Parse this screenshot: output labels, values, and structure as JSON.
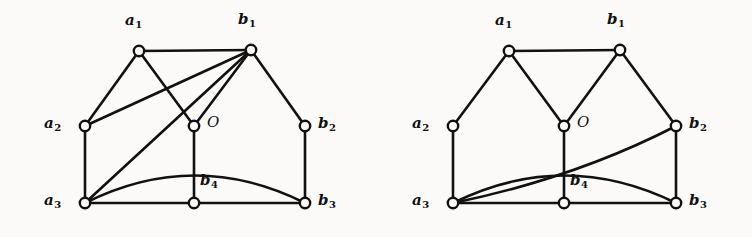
{
  "figure": {
    "background_color": "#fbfaf8",
    "ink_color": "#111111",
    "width": 752,
    "height": 237,
    "panel_count": 2
  },
  "chart_data": {
    "type": "diagram",
    "title": "",
    "subtitle": "",
    "xlabel": "",
    "ylabel": "",
    "graphs": [
      {
        "name": "left-graph",
        "vertex_labels": [
          "a1",
          "b1",
          "a2",
          "O",
          "b2",
          "a3",
          "b4",
          "b3"
        ],
        "vertices": [
          {
            "id": "a1",
            "label_main": "a",
            "label_sub": "1",
            "x": 139,
            "y": 51,
            "label_x": 125,
            "label_y": 13,
            "label_pos": "above"
          },
          {
            "id": "b1",
            "label_main": "b",
            "label_sub": "1",
            "x": 251,
            "y": 50,
            "label_x": 238,
            "label_y": 12,
            "label_pos": "above"
          },
          {
            "id": "a2",
            "label_main": "a",
            "label_sub": "2",
            "x": 85,
            "y": 126,
            "label_x": 44,
            "label_y": 116,
            "label_pos": "left"
          },
          {
            "id": "O",
            "label_main": "O",
            "label_sub": "",
            "x": 194,
            "y": 126,
            "label_x": 207,
            "label_y": 115,
            "label_pos": "right"
          },
          {
            "id": "b2",
            "label_main": "b",
            "label_sub": "2",
            "x": 305,
            "y": 126,
            "label_x": 318,
            "label_y": 116,
            "label_pos": "right"
          },
          {
            "id": "a3",
            "label_main": "a",
            "label_sub": "3",
            "x": 85,
            "y": 203,
            "label_x": 44,
            "label_y": 193,
            "label_pos": "left"
          },
          {
            "id": "b4",
            "label_main": "b",
            "label_sub": "4",
            "x": 194,
            "y": 203,
            "label_x": 200,
            "label_y": 173,
            "label_pos": "above-right"
          },
          {
            "id": "b3",
            "label_main": "b",
            "label_sub": "3",
            "x": 305,
            "y": 203,
            "label_x": 318,
            "label_y": 193,
            "label_pos": "right"
          }
        ],
        "straight_edges": [
          [
            "a1",
            "b1"
          ],
          [
            "a1",
            "a2"
          ],
          [
            "a1",
            "O"
          ],
          [
            "b1",
            "a2"
          ],
          [
            "b1",
            "a3"
          ],
          [
            "b1",
            "O"
          ],
          [
            "b1",
            "b2"
          ],
          [
            "a2",
            "a3"
          ],
          [
            "O",
            "b4"
          ],
          [
            "b2",
            "b3"
          ],
          [
            "a3",
            "b4"
          ],
          [
            "b4",
            "b3"
          ]
        ],
        "curved_edges": [
          {
            "from": "a3",
            "to": "b3",
            "bulge": "up",
            "ctrl_x": 195,
            "ctrl_y": 148
          }
        ]
      },
      {
        "name": "right-graph",
        "vertex_labels": [
          "a1",
          "b1",
          "a2",
          "O",
          "b2",
          "a3",
          "b4",
          "b3"
        ],
        "vertices": [
          {
            "id": "a1",
            "label_main": "a",
            "label_sub": "1",
            "x": 509,
            "y": 51,
            "label_x": 495,
            "label_y": 13,
            "label_pos": "above"
          },
          {
            "id": "b1",
            "label_main": "b",
            "label_sub": "1",
            "x": 620,
            "y": 50,
            "label_x": 607,
            "label_y": 12,
            "label_pos": "above"
          },
          {
            "id": "a2",
            "label_main": "a",
            "label_sub": "2",
            "x": 453,
            "y": 126,
            "label_x": 412,
            "label_y": 116,
            "label_pos": "left"
          },
          {
            "id": "O",
            "label_main": "O",
            "label_sub": "",
            "x": 564,
            "y": 126,
            "label_x": 577,
            "label_y": 115,
            "label_pos": "right"
          },
          {
            "id": "b2",
            "label_main": "b",
            "label_sub": "2",
            "x": 676,
            "y": 126,
            "label_x": 689,
            "label_y": 116,
            "label_pos": "right"
          },
          {
            "id": "a3",
            "label_main": "a",
            "label_sub": "3",
            "x": 453,
            "y": 203,
            "label_x": 412,
            "label_y": 193,
            "label_pos": "left"
          },
          {
            "id": "b4",
            "label_main": "b",
            "label_sub": "4",
            "x": 564,
            "y": 203,
            "label_x": 570,
            "label_y": 173,
            "label_pos": "above-right"
          },
          {
            "id": "b3",
            "label_main": "b",
            "label_sub": "3",
            "x": 676,
            "y": 203,
            "label_x": 689,
            "label_y": 193,
            "label_pos": "right"
          }
        ],
        "straight_edges": [
          [
            "a1",
            "b1"
          ],
          [
            "a1",
            "a2"
          ],
          [
            "a1",
            "O"
          ],
          [
            "b1",
            "O"
          ],
          [
            "b1",
            "b2"
          ],
          [
            "a2",
            "a3"
          ],
          [
            "O",
            "b4"
          ],
          [
            "b2",
            "b3"
          ],
          [
            "a3",
            "b4"
          ],
          [
            "b4",
            "b3"
          ]
        ],
        "curved_edges": [
          {
            "from": "a3",
            "to": "b3",
            "bulge": "up",
            "ctrl_x": 564,
            "ctrl_y": 148
          },
          {
            "from": "a3",
            "to": "b2",
            "bulge": "up",
            "ctrl_x": 575,
            "ctrl_y": 178
          }
        ]
      }
    ],
    "node_radius": 5.2,
    "edge_width": 2.6,
    "grid": false,
    "legend": "none"
  }
}
